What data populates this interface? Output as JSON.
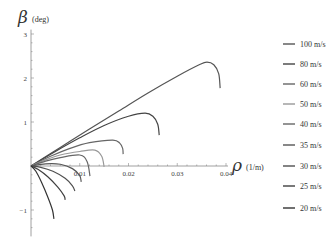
{
  "chart_data": {
    "type": "line",
    "title": "",
    "xlabel_symbol": "ρ",
    "xlabel_unit": "(1/m)",
    "ylabel_symbol": "β",
    "ylabel_unit": "(deg)",
    "xlim": [
      0,
      0.04
    ],
    "ylim": [
      -1.6,
      3.1
    ],
    "x_ticks": [
      0.01,
      0.02,
      0.03,
      0.04
    ],
    "x_tick_labels": [
      "0.01",
      "0.02",
      "0.03",
      "0.04"
    ],
    "y_ticks": [
      -1,
      1,
      2,
      3
    ],
    "y_tick_labels": [
      "−1",
      "1",
      "2",
      "3"
    ],
    "grid": false,
    "legend_position": "right",
    "series": [
      {
        "name": "100 m/s",
        "color": "#555555",
        "points": [
          [
            0,
            0
          ],
          [
            0.006,
            0.42
          ],
          [
            0.012,
            0.84
          ],
          [
            0.018,
            1.25
          ],
          [
            0.024,
            1.66
          ],
          [
            0.03,
            2.04
          ],
          [
            0.0345,
            2.3
          ],
          [
            0.0361,
            2.36
          ],
          [
            0.0375,
            2.3
          ],
          [
            0.0385,
            2.1
          ],
          [
            0.0388,
            1.77
          ]
        ]
      },
      {
        "name": "80 m/s",
        "color": "#444444",
        "points": [
          [
            0,
            0
          ],
          [
            0.005,
            0.33
          ],
          [
            0.01,
            0.64
          ],
          [
            0.015,
            0.92
          ],
          [
            0.02,
            1.13
          ],
          [
            0.0234,
            1.2
          ],
          [
            0.025,
            1.13
          ],
          [
            0.026,
            0.95
          ],
          [
            0.0263,
            0.7
          ]
        ]
      },
      {
        "name": "60 m/s",
        "color": "#666666",
        "points": [
          [
            0,
            0
          ],
          [
            0.004,
            0.22
          ],
          [
            0.008,
            0.4
          ],
          [
            0.012,
            0.53
          ],
          [
            0.0168,
            0.59
          ],
          [
            0.0182,
            0.52
          ],
          [
            0.0188,
            0.4
          ],
          [
            0.0189,
            0.27
          ]
        ]
      },
      {
        "name": "50 m/s",
        "color": "#999999",
        "points": [
          [
            0,
            0
          ],
          [
            0.003,
            0.14
          ],
          [
            0.006,
            0.25
          ],
          [
            0.01,
            0.33
          ],
          [
            0.0131,
            0.36
          ],
          [
            0.0145,
            0.22
          ],
          [
            0.015,
            -0.02
          ]
        ]
      },
      {
        "name": "40 m/s",
        "color": "#666666",
        "points": [
          [
            0,
            0
          ],
          [
            0.003,
            0.11
          ],
          [
            0.006,
            0.19
          ],
          [
            0.01,
            0.25
          ],
          [
            0.0115,
            0.1
          ],
          [
            0.0121,
            -0.23
          ]
        ]
      },
      {
        "name": "35 m/s",
        "color": "#555555",
        "points": [
          [
            0,
            0
          ],
          [
            0.003,
            0.05
          ],
          [
            0.006,
            0.04
          ],
          [
            0.0085,
            -0.06
          ],
          [
            0.01,
            -0.22
          ],
          [
            0.0103,
            -0.36
          ]
        ]
      },
      {
        "name": "30 m/s",
        "color": "#505050",
        "points": [
          [
            0,
            0
          ],
          [
            0.002,
            -0.03
          ],
          [
            0.0045,
            -0.12
          ],
          [
            0.007,
            -0.28
          ],
          [
            0.0085,
            -0.45
          ],
          [
            0.009,
            -0.57
          ]
        ]
      },
      {
        "name": "25 m/s",
        "color": "#404040",
        "points": [
          [
            0,
            0
          ],
          [
            0.0015,
            -0.08
          ],
          [
            0.0035,
            -0.25
          ],
          [
            0.0055,
            -0.48
          ],
          [
            0.0068,
            -0.68
          ],
          [
            0.007,
            -0.77
          ]
        ]
      },
      {
        "name": "20 m/s",
        "color": "#333333",
        "points": [
          [
            0,
            0
          ],
          [
            0.001,
            -0.12
          ],
          [
            0.0022,
            -0.38
          ],
          [
            0.0035,
            -0.72
          ],
          [
            0.0044,
            -1.0
          ],
          [
            0.0047,
            -1.2
          ]
        ]
      }
    ]
  }
}
